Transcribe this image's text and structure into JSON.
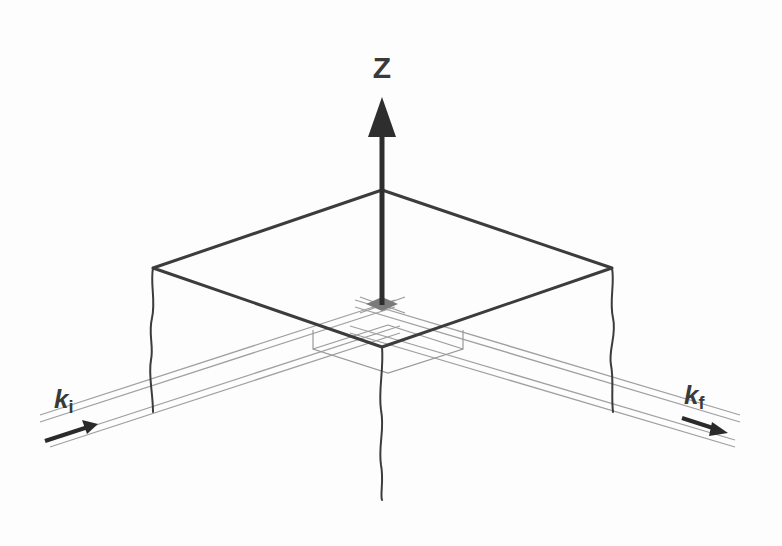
{
  "diagram": {
    "type": "scattering-geometry",
    "axis": {
      "label": "Z",
      "direction": "up",
      "color": "#2e2e2e"
    },
    "incident_beam": {
      "symbol": "k",
      "subscript": "i",
      "direction": "into-sample"
    },
    "final_beam": {
      "symbol": "k",
      "subscript": "f",
      "direction": "out-of-sample"
    },
    "sample": {
      "shape": "square-slab-with-broken-edges",
      "edge_color": "#3c3c3c",
      "beam_spot_color": "#7a7a7a"
    },
    "colors": {
      "background": "#fdfdfd",
      "beam_lines": "#9a9a9a",
      "edges": "#3c3c3c",
      "arrow": "#2a2a2a"
    }
  }
}
